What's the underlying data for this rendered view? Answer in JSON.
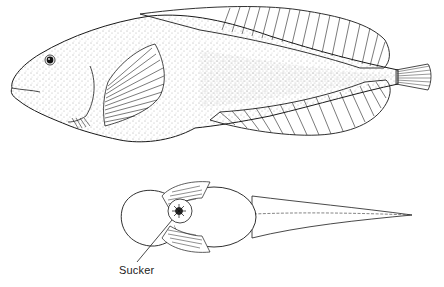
{
  "figure": {
    "views": [
      {
        "name": "lateral-view",
        "description": "Side view of fish with stippled body, pectoral fin, long dorsal and anal fins, small caudal fin"
      },
      {
        "name": "ventral-view",
        "description": "Underside view showing pelvic sucker disc and tapering tail"
      }
    ],
    "labels": {
      "sucker": "Sucker"
    },
    "colors": {
      "ink": "#1a1a1a",
      "background": "#ffffff",
      "stipple": "#555555"
    }
  }
}
